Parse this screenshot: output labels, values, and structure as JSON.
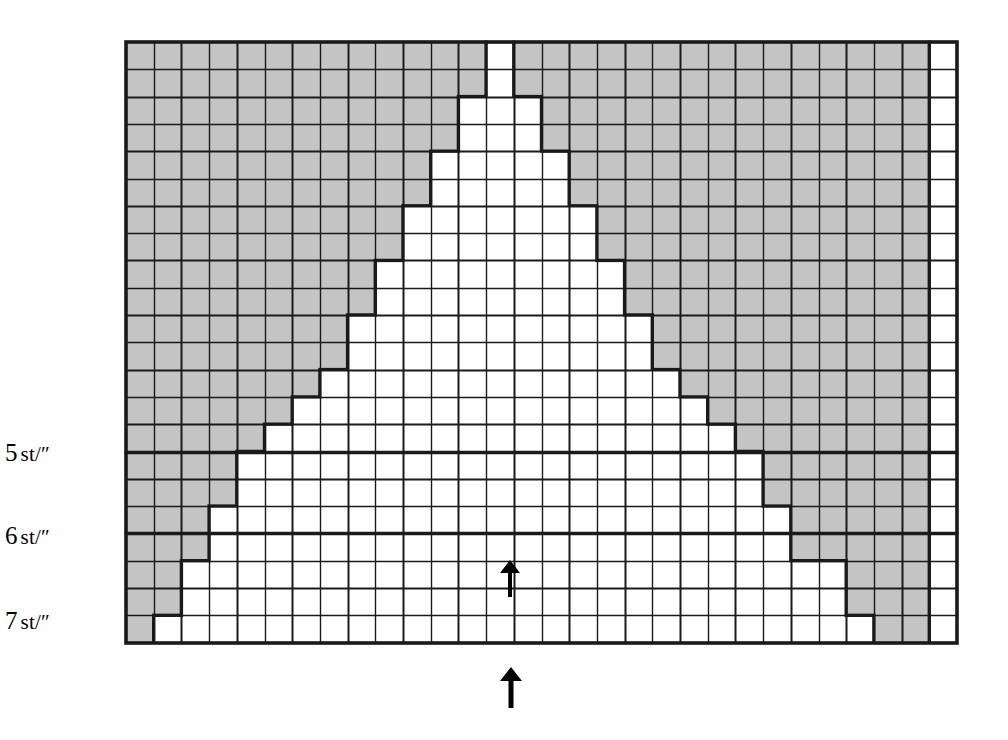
{
  "figure": {
    "type": "knitting-gauge-chart",
    "background_color": "#ffffff",
    "shaded_color": "#c4c4c4",
    "unshaded_color": "#ffffff",
    "line_color": "#1a1a1a"
  },
  "grid": {
    "origin_x": 126,
    "origin_y": 42,
    "columns": 30,
    "rows": 22,
    "cell_width": 27.7,
    "cell_height": 27.3,
    "thin_line_width": 1.4,
    "thick_line_width": 3.4,
    "border_line_width": 3.6
  },
  "axis_labels": [
    {
      "name": "gauge-5",
      "number": "5",
      "unit": "st/″",
      "x": 50,
      "y": 452,
      "row_index": 15
    },
    {
      "name": "gauge-6",
      "number": "6",
      "unit": "st/″",
      "x": 50,
      "y": 535,
      "row_index": 18
    },
    {
      "name": "gauge-7",
      "number": "7",
      "unit": "st/″",
      "x": 50,
      "y": 620,
      "row_index": 22
    }
  ],
  "gauge_lines": [
    {
      "label": "5 st/″",
      "row": 15,
      "thick": true
    },
    {
      "label": "6 st/″",
      "row": 18,
      "thick": true
    },
    {
      "label": "7 st/″",
      "row": 22,
      "thick": true
    }
  ],
  "markers": [
    {
      "name": "inner-up-arrow",
      "glyph": "↑",
      "x": 498,
      "y": 558,
      "height": 40,
      "inside_grid": true
    },
    {
      "name": "outer-up-arrow",
      "glyph": "↑",
      "x": 498,
      "y": 665,
      "height": 44,
      "inside_grid": false
    }
  ],
  "chart_data": {
    "type": "heatmap",
    "title": "",
    "xlabel": "",
    "ylabel": "",
    "legend": [
      {
        "label": "unshaded (in range)",
        "color": "#ffffff"
      },
      {
        "label": "shaded (out of range)",
        "color": "#c4c4c4"
      }
    ],
    "grid": true,
    "columns": 30,
    "rows": 22,
    "note": "Each row lists [first_white_col, last_white_col] inclusive, 0-indexed from left. Cells outside that span are shaded gray. Column 29 (rightmost) is always white.",
    "white_spans": [
      {
        "row": 0,
        "start": 13,
        "end": 13
      },
      {
        "row": 1,
        "start": 13,
        "end": 13
      },
      {
        "row": 2,
        "start": 12,
        "end": 14
      },
      {
        "row": 3,
        "start": 12,
        "end": 14
      },
      {
        "row": 4,
        "start": 11,
        "end": 15
      },
      {
        "row": 5,
        "start": 11,
        "end": 15
      },
      {
        "row": 6,
        "start": 10,
        "end": 16
      },
      {
        "row": 7,
        "start": 10,
        "end": 16
      },
      {
        "row": 8,
        "start": 9,
        "end": 17
      },
      {
        "row": 9,
        "start": 9,
        "end": 17
      },
      {
        "row": 10,
        "start": 8,
        "end": 18
      },
      {
        "row": 11,
        "start": 8,
        "end": 18
      },
      {
        "row": 12,
        "start": 7,
        "end": 19
      },
      {
        "row": 13,
        "start": 6,
        "end": 20
      },
      {
        "row": 14,
        "start": 5,
        "end": 21
      },
      {
        "row": 15,
        "start": 4,
        "end": 22
      },
      {
        "row": 16,
        "start": 4,
        "end": 22
      },
      {
        "row": 17,
        "start": 3,
        "end": 23
      },
      {
        "row": 18,
        "start": 3,
        "end": 23
      },
      {
        "row": 19,
        "start": 2,
        "end": 25
      },
      {
        "row": 20,
        "start": 2,
        "end": 25
      },
      {
        "row": 21,
        "start": 1,
        "end": 26
      }
    ],
    "right_white_column": 29
  }
}
